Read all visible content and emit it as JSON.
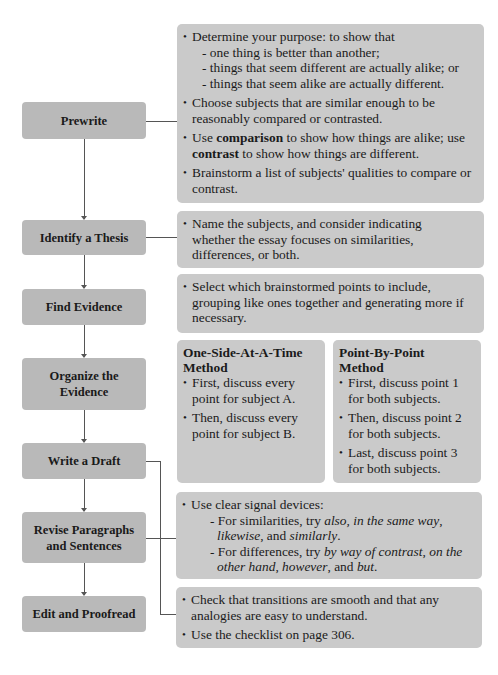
{
  "steps": [
    {
      "label": "Prewrite"
    },
    {
      "label": "Identify a Thesis"
    },
    {
      "label": "Find Evidence"
    },
    {
      "label": "Organize the Evidence",
      "line1": "Organize the",
      "line2": "Evidence"
    },
    {
      "label": "Write a Draft"
    },
    {
      "label": "Revise Paragraphs and Sentences",
      "line1": "Revise Paragraphs",
      "line2": "and Sentences"
    },
    {
      "label": "Edit and Proofread"
    }
  ],
  "prewrite": {
    "b1": "Determine your purpose: to show that",
    "b1_subs": [
      "- one thing is better than another;",
      "- things that seem different are actually alike; or",
      "- things that seem alike are actually different."
    ],
    "b2": "Choose subjects that are similar enough to be reasonably compared or contrasted.",
    "b3_pre": "Use ",
    "b3_bold1": "comparison",
    "b3_mid": " to show how things are alike; use ",
    "b3_bold2": "contrast",
    "b3_post": " to show how things are different.",
    "b4": "Brainstorm a list of subjects' qualities to compare or contrast."
  },
  "thesis": {
    "b1": "Name the subjects, and consider indicating whether the essay focuses on similarities, differences, or both."
  },
  "evidence": {
    "b1": "Select which brainstormed points to include, grouping like ones together and generating more if necessary."
  },
  "organize": {
    "left": {
      "title": "One-Side-At-A-Time Method",
      "bullets": [
        "First, discuss every point for subject A.",
        "Then, discuss every point for subject B."
      ]
    },
    "right": {
      "title": "Point-By-Point Method",
      "bullets": [
        "First, discuss point 1 for both subjects.",
        "Then, discuss point 2 for both subjects.",
        "Last, discuss point 3 for both subjects."
      ]
    }
  },
  "revise": {
    "b1": "Use clear signal devices:",
    "sim_pre": "For similarities, try ",
    "sim_i1": "also, in the same way",
    "sim_c1": ", ",
    "sim_i2": "likewise",
    "sim_c2": ", and ",
    "sim_i3": "similarly",
    "sim_end": ".",
    "diff_pre": "For differences, try ",
    "diff_i1": "by way of contrast",
    "diff_c1": ", ",
    "diff_i2": "on the other hand",
    "diff_c2": ", ",
    "diff_i3": "however",
    "diff_c3": ", and ",
    "diff_i4": "but",
    "diff_end": "."
  },
  "edit": {
    "b1": "Check that transitions are smooth and that any analogies are easy to understand.",
    "b2": "Use the checklist on page 306."
  },
  "colors": {
    "step_box": "#b9b9b9",
    "panel": "#cacaca",
    "connector": "#555555"
  }
}
